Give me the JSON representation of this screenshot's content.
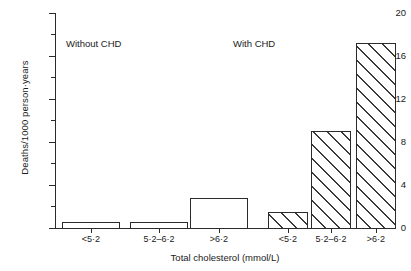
{
  "chart_data": {
    "type": "bar",
    "title": "",
    "subtitle": "",
    "xlabel": "Total cholesterol (mmol/L)",
    "ylabel": "Deaths/1000 person·years",
    "categories": [
      "<5·2",
      "5·2–6·2",
      ">6·2"
    ],
    "series": [
      {
        "name": "Without CHD",
        "fill": "open",
        "values": [
          0.6,
          0.6,
          2.8
        ]
      },
      {
        "name": "With CHD",
        "fill": "diagonal-hatch",
        "values": [
          1.5,
          9.0,
          17.2
        ]
      }
    ],
    "ylim": [
      0,
      20
    ],
    "ytick_labels": [
      "0",
      "4",
      "8",
      "12",
      "16",
      "20"
    ],
    "ytick_values": [
      0,
      4,
      8,
      12,
      16,
      20
    ],
    "yminor_values": [
      2,
      6,
      10,
      14,
      18
    ],
    "grid": false,
    "legend_position": "inline-annotations",
    "annotations": [
      {
        "text": "Without CHD",
        "group": 0
      },
      {
        "text": "With CHD",
        "group": 1
      }
    ],
    "axis_color": "#2b2b2b",
    "bar_edge_color": "#2b2b2b",
    "bar_face_color": "#ffffff",
    "hatch_color": "#3a3a3a"
  }
}
